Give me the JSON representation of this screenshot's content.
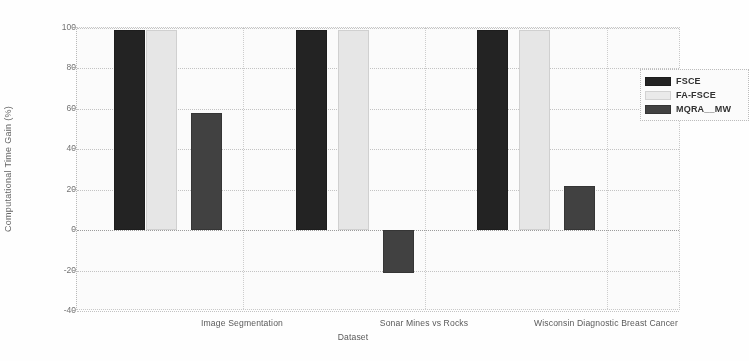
{
  "chart_data": {
    "type": "bar",
    "title": "",
    "xlabel": "Dataset",
    "ylabel": "Computational Time Gain (%)",
    "categories": [
      "Image Segmentation",
      "Sonar Mines vs Rocks",
      "Wisconsin Diagnostic Breast Cancer"
    ],
    "series": [
      {
        "name": "FSCE",
        "color": "#1b1b1b",
        "values": [
          99,
          99,
          99
        ]
      },
      {
        "name": "FA-FSCE",
        "color": "#e9e9e9",
        "values": [
          99,
          99,
          99
        ]
      },
      {
        "name": "MQRA__MW",
        "color": "#3b3b3b",
        "values": [
          58,
          -21,
          22
        ]
      }
    ],
    "ylim": [
      -40,
      100
    ],
    "yticks": [
      -40,
      -20,
      0,
      20,
      40,
      60,
      80,
      100
    ],
    "ytick_labels": [
      "-40",
      "-20",
      "0",
      "20",
      "40",
      "60",
      "80",
      "100"
    ],
    "grid": true,
    "legend_position": "top-right"
  }
}
